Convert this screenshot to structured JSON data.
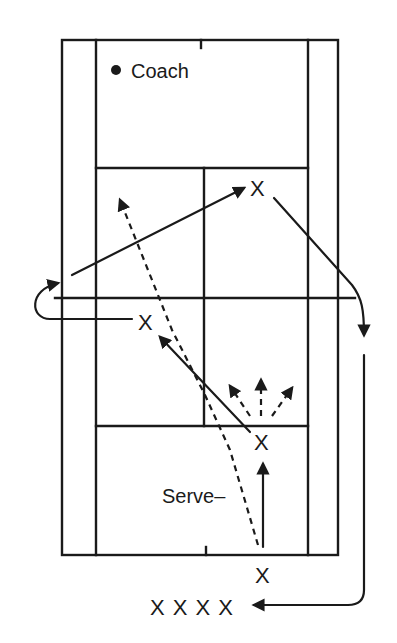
{
  "diagram": {
    "type": "tennis-drill",
    "colors": {
      "ink": "#1a1a1a",
      "background": "#ffffff"
    },
    "labels": {
      "coach": "Coach",
      "serve": "Serve–",
      "player_mark": "X",
      "queue": "X X X X"
    },
    "court": {
      "outer": {
        "x1": 62,
        "y1": 40,
        "x2": 338,
        "y2": 555
      },
      "singles_left_x": 96,
      "singles_right_x": 308,
      "net_y": 298,
      "net_x1": 55,
      "net_x2": 355,
      "service_line_top_y": 168,
      "service_line_bottom_y": 426,
      "center_service_x": 204
    },
    "players": [
      {
        "id": "far-player",
        "x": 258,
        "y": 188
      },
      {
        "id": "net-player",
        "x": 146,
        "y": 322
      },
      {
        "id": "server-forward",
        "x": 262,
        "y": 442
      },
      {
        "id": "server-baseline",
        "x": 263,
        "y": 575
      }
    ],
    "queue_position": {
      "x": 152,
      "y": 607
    },
    "coach_position": {
      "x": 116,
      "y": 70
    }
  }
}
